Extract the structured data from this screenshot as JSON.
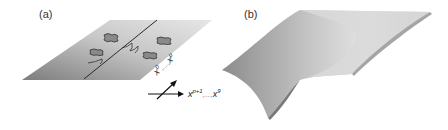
{
  "figure": {
    "panel_a": {
      "label": "(a)",
      "axis_diagonal": {
        "base": "x",
        "sup_start": "0",
        "ellipsis": ",....,",
        "sup_end": "p"
      },
      "axis_horizontal": {
        "base": "x",
        "sup_start": "p+1",
        "ellipsis": ",....,",
        "sup_end": "9"
      }
    },
    "panel_b": {
      "label": "(b)"
    },
    "colors": {
      "plane_dark": "#8a8a8a",
      "plane_light": "#dcdcdc",
      "line": "#2a2a2a"
    }
  }
}
